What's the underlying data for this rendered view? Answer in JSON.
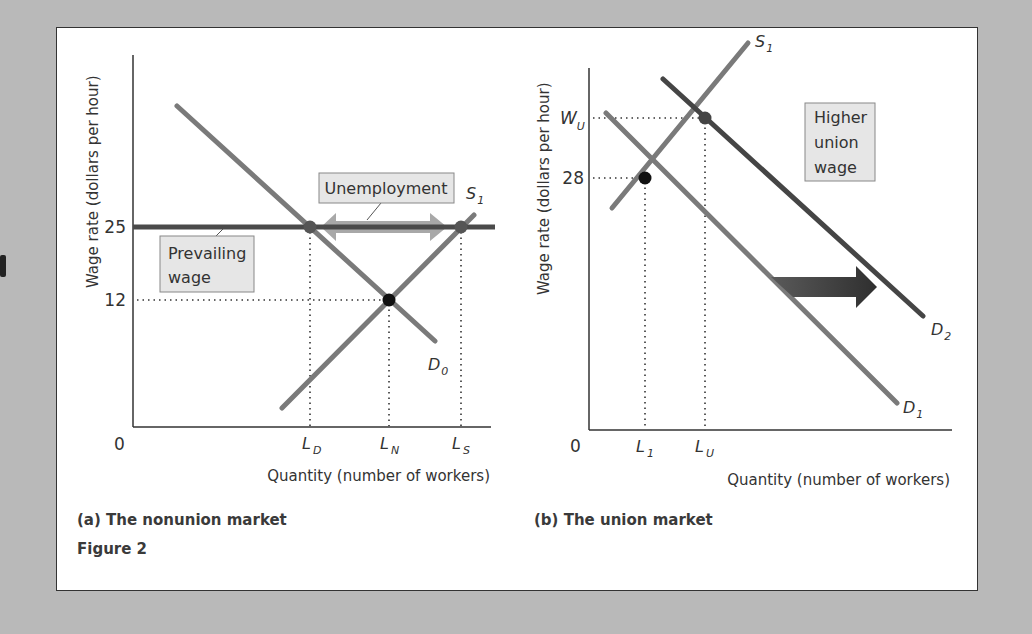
{
  "figure": {
    "title": "Figure 2",
    "panels": [
      {
        "caption": "(a) The nonunion market",
        "ylabel": "Wage rate (dollars per hour)",
        "xlabel": "Quantity (number of workers)",
        "origin_label": "0",
        "y_ticks": [
          {
            "label": "25"
          },
          {
            "label": "12"
          }
        ],
        "x_ticks": [
          {
            "main": "L",
            "sub": "D"
          },
          {
            "main": "L",
            "sub": "N"
          },
          {
            "main": "L",
            "sub": "S"
          }
        ],
        "curves": [
          {
            "id": "D0",
            "main": "D",
            "sub": "0",
            "kind": "demand"
          },
          {
            "id": "S1",
            "main": "S",
            "sub": "1",
            "kind": "supply"
          },
          {
            "id": "prevailing",
            "kind": "horizontal wage line at 25"
          }
        ],
        "annotations": [
          {
            "id": "unemployment",
            "text": "Unemployment",
            "note": "double arrow from LD to LS at wage 25"
          },
          {
            "id": "prevailing-wage",
            "line1": "Prevailing",
            "line2": "wage"
          }
        ],
        "points": [
          {
            "name": "LD at 25",
            "style": "gray"
          },
          {
            "name": "equilibrium LN at 12",
            "style": "black"
          },
          {
            "name": "LS at 25",
            "style": "gray"
          }
        ]
      },
      {
        "caption": "(b) The union market",
        "ylabel": "Wage rate (dollars per hour)",
        "xlabel": "Quantity (number of workers)",
        "origin_label": "0",
        "y_ticks": [
          {
            "main": "W",
            "sub": "U"
          },
          {
            "label": "28"
          }
        ],
        "x_ticks": [
          {
            "main": "L",
            "sub": "1"
          },
          {
            "main": "L",
            "sub": "U"
          }
        ],
        "curves": [
          {
            "id": "S1",
            "main": "S",
            "sub": "1",
            "kind": "supply"
          },
          {
            "id": "D1",
            "main": "D",
            "sub": "1",
            "kind": "demand"
          },
          {
            "id": "D2",
            "main": "D",
            "sub": "2",
            "kind": "demand (shifted right)"
          }
        ],
        "annotations": [
          {
            "id": "higher-union-wage",
            "line1": "Higher",
            "line2": "union",
            "line3": "wage"
          },
          {
            "id": "shift-arrow",
            "note": "rightward arrow from D1 to D2"
          }
        ],
        "points": [
          {
            "name": "L1 at 28",
            "style": "black"
          },
          {
            "name": "LU at WU",
            "style": "gray"
          }
        ]
      }
    ]
  },
  "colors": {
    "curve_light": "#7a7a7a",
    "curve_dark": "#454545",
    "prevailing_line": "#4a4a4a",
    "unemployment_arrow": "#a8a8a8",
    "shift_arrow": "#3c3c3c",
    "label_box_fill": "#e6e6e6",
    "page_bg": "#b9b9b9"
  }
}
